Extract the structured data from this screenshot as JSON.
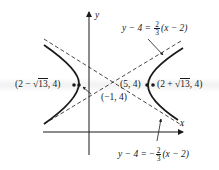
{
  "diagram": {
    "type": "hyperbola",
    "colors": {
      "ink": "#1a1a1a",
      "background": "#ffffff"
    },
    "axes": {
      "x_label": "x",
      "y_label": "y"
    },
    "asymptotes": [
      {
        "id": "upper",
        "lhs": "y − 4 =",
        "num": "2",
        "den": "3",
        "sign": "",
        "rhs": "(x − 2)"
      },
      {
        "id": "lower",
        "lhs": "y − 4 =",
        "num": "2",
        "den": "3",
        "sign": "−",
        "rhs": "(x − 2)"
      }
    ],
    "points": {
      "left_focus": {
        "prefix": "(2 − ",
        "root": "13",
        "suffix": ", 4)"
      },
      "right_focus": {
        "prefix": "(2 + ",
        "root": "13",
        "suffix": ", 4)"
      },
      "left_vertex": "(−1, 4)",
      "right_vertex": "(5, 4)"
    }
  }
}
